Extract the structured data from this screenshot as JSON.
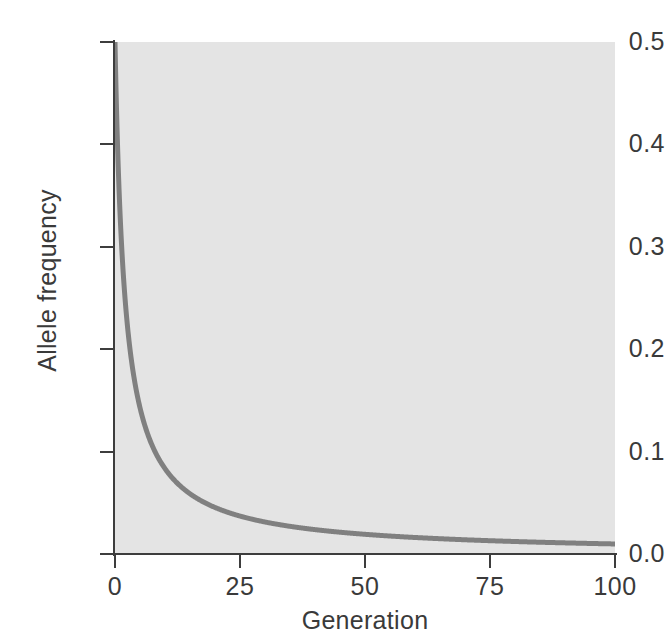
{
  "chart_data": {
    "type": "line",
    "title": "",
    "subtitle": "",
    "xlabel": "Generation",
    "ylabel": "Allele frequency",
    "xlim": [
      0,
      100
    ],
    "ylim": [
      0.0,
      0.5
    ],
    "xticks": [
      0,
      25,
      50,
      75,
      100
    ],
    "xticklabels": [
      "0",
      "25",
      "50",
      "75",
      "100"
    ],
    "yticks": [
      0.0,
      0.1,
      0.2,
      0.3,
      0.4,
      0.5
    ],
    "yticklabels": [
      "0.0",
      "0.1",
      "0.2",
      "0.3",
      "0.4",
      "0.5"
    ],
    "grid": false,
    "legend": false,
    "legend_position": "none",
    "plot_background": "#e4e4e4",
    "figure_background": "#ffffff",
    "line_color": "#808080",
    "line_width": 5,
    "axis_color": "#3d3d3d",
    "text_color": "#3a3a3a",
    "annotations": [],
    "series": [
      {
        "name": "Allele frequency",
        "color": "#808080",
        "x": [
          0,
          1,
          2,
          3,
          4,
          5,
          6,
          7,
          8,
          9,
          10,
          12,
          14,
          16,
          18,
          20,
          22,
          25,
          28,
          30,
          35,
          40,
          45,
          50,
          55,
          60,
          65,
          70,
          75,
          80,
          85,
          90,
          95,
          100
        ],
        "y": [
          0.5,
          0.333,
          0.25,
          0.2,
          0.167,
          0.143,
          0.125,
          0.111,
          0.1,
          0.091,
          0.083,
          0.071,
          0.063,
          0.056,
          0.05,
          0.045,
          0.042,
          0.037,
          0.033,
          0.031,
          0.027,
          0.024,
          0.022,
          0.02,
          0.018,
          0.016,
          0.015,
          0.014,
          0.013,
          0.012,
          0.012,
          0.011,
          0.01,
          0.01
        ]
      }
    ]
  },
  "axes": {
    "y_title": "Allele frequency",
    "x_title": "Generation",
    "y_tick_labels": [
      "0.5",
      "0.4",
      "0.3",
      "0.2",
      "0.1",
      "0.0"
    ],
    "x_tick_labels": [
      "0",
      "25",
      "50",
      "75",
      "100"
    ]
  }
}
